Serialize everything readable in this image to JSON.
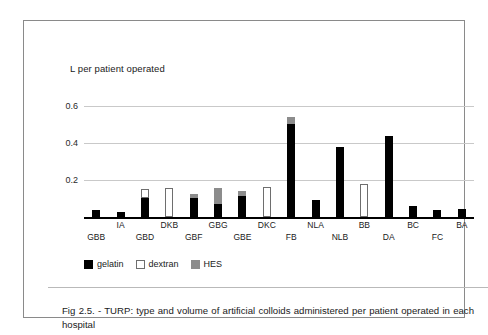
{
  "figure": {
    "axis_title": "L per patient operated",
    "caption": "Fig 2.5. - TURP: type and volume of artificial colloids administered per patient operated in each hospital"
  },
  "legend": {
    "items": [
      {
        "label": "gelatin",
        "color": "#000000",
        "key": "gelatin"
      },
      {
        "label": "dextran",
        "color": "#ffffff",
        "key": "dextran"
      },
      {
        "label": "HES",
        "color": "#8c8c8c",
        "key": "hes"
      }
    ]
  },
  "chart_data": {
    "type": "bar",
    "title": "",
    "subtitle": "",
    "xlabel": "",
    "ylabel": "L per patient operated",
    "ylim": [
      0,
      0.68
    ],
    "yticks": [
      0.2,
      0.4,
      0.6
    ],
    "ytick_labels": [
      "0.2",
      "0.4",
      "0.6"
    ],
    "grid": true,
    "stacked": true,
    "legend_position": "bottom-left",
    "categories": [
      "GBB",
      "IA",
      "GBD",
      "DKB",
      "GBF",
      "GBG",
      "GBE",
      "DKC",
      "FB",
      "NLA",
      "NLB",
      "BB",
      "DA",
      "BC",
      "FC",
      "BA"
    ],
    "category_label_rows": [
      "bottom",
      "top",
      "bottom",
      "top",
      "bottom",
      "top",
      "bottom",
      "top",
      "bottom",
      "top",
      "bottom",
      "top",
      "bottom",
      "top",
      "bottom",
      "top"
    ],
    "series": [
      {
        "name": "gelatin",
        "color": "#000000",
        "values": [
          0.04,
          0.025,
          0.1,
          0.0,
          0.1,
          0.07,
          0.115,
          0.0,
          0.5,
          0.09,
          0.38,
          0.0,
          0.435,
          0.06,
          0.04,
          0.045
        ]
      },
      {
        "name": "dextran",
        "color": "#ffffff",
        "values": [
          0.0,
          0.0,
          0.05,
          0.155,
          0.0,
          0.0,
          0.0,
          0.16,
          0.0,
          0.0,
          0.0,
          0.18,
          0.0,
          0.0,
          0.0,
          0.0
        ]
      },
      {
        "name": "HES",
        "color": "#8c8c8c",
        "values": [
          0.0,
          0.0,
          0.0,
          0.0,
          0.025,
          0.085,
          0.025,
          0.0,
          0.04,
          0.0,
          0.0,
          0.0,
          0.0,
          0.0,
          0.0,
          0.0
        ]
      }
    ],
    "totals": [
      0.04,
      0.025,
      0.15,
      0.155,
      0.125,
      0.155,
      0.14,
      0.16,
      0.54,
      0.09,
      0.38,
      0.18,
      0.435,
      0.06,
      0.04,
      0.045
    ]
  }
}
